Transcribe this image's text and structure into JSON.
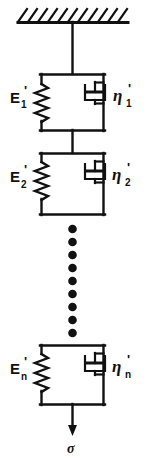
{
  "figure": {
    "stroke_color": "#111111",
    "background_color": "#ffffff",
    "support": {
      "name": "fixed-support-hatching",
      "hatch_count": 11
    },
    "elements": [
      {
        "id": "element-1",
        "spring_label": {
          "symbol": "E",
          "subscript": "1",
          "prime": "'"
        },
        "dashpot_label": {
          "symbol": "η",
          "subscript": "1",
          "prime": "'"
        }
      },
      {
        "id": "element-2",
        "spring_label": {
          "symbol": "E",
          "subscript": "2",
          "prime": "'"
        },
        "dashpot_label": {
          "symbol": "η",
          "subscript": "2",
          "prime": "'"
        }
      },
      {
        "id": "element-n",
        "spring_label": {
          "symbol": "E",
          "subscript": "n",
          "prime": "'"
        },
        "dashpot_label": {
          "symbol": "η",
          "subscript": "n",
          "prime": "'"
        }
      }
    ],
    "ellipsis": {
      "name": "vertical-dot-ellipsis",
      "dot_count": 9
    },
    "load": {
      "name": "stress-arrow",
      "label": "σ"
    }
  }
}
